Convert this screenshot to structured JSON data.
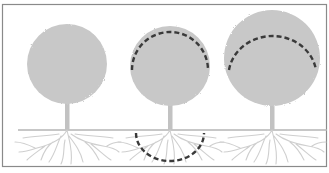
{
  "diagram": {
    "colors": {
      "background": "#ffffff",
      "frame": "#8a8a8a",
      "ground": "#b5b5b5",
      "canopy": "#c8c8c8",
      "trunk": "#c2c2c2",
      "roots": "#cfcfcf",
      "dashed_arc": "#3a3a3a"
    },
    "trees": [
      {
        "id": "tree-1",
        "label": "",
        "canopy_cx": 67,
        "canopy_cy": 64,
        "canopy_r": 40,
        "has_canopy_arc": false,
        "has_root_arc": false
      },
      {
        "id": "tree-2",
        "label": "",
        "canopy_cx": 170,
        "canopy_cy": 66,
        "canopy_r": 40,
        "has_canopy_arc": true,
        "has_root_arc": true
      },
      {
        "id": "tree-3",
        "label": "",
        "canopy_cx": 272,
        "canopy_cy": 58,
        "canopy_r": 48,
        "has_canopy_arc": true,
        "has_root_arc": false
      }
    ],
    "ground_y": 130
  }
}
